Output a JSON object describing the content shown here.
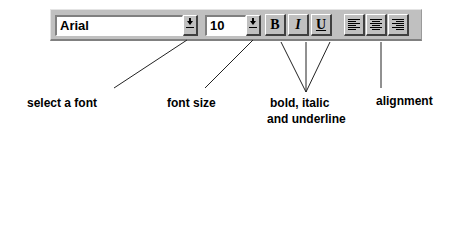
{
  "toolbar": {
    "font_field": {
      "value": "Arial"
    },
    "size_field": {
      "value": "10"
    },
    "buttons": {
      "bold": "B",
      "italic": "I",
      "underline": "U"
    },
    "alignment": [
      "align-left",
      "align-center",
      "align-right"
    ]
  },
  "annotations": {
    "select_font": "select a font",
    "font_size": "font size",
    "bold_italic_line1": "bold, italic",
    "bold_italic_line2": "and underline",
    "alignment": "alignment"
  },
  "colors": {
    "toolbar_bg": "#c0c0c0",
    "field_bg": "#ffffff",
    "text": "#000000"
  }
}
